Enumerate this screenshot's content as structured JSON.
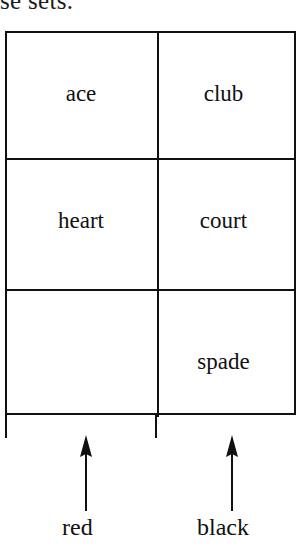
{
  "page": {
    "clipped_heading_fragment": "se sets.",
    "background_color": "#ffffff",
    "ink_color": "#111111"
  },
  "table": {
    "columns": 2,
    "rows": 3,
    "rows_data": [
      {
        "left": "ace",
        "right": "club"
      },
      {
        "left": "heart",
        "right": "court"
      },
      {
        "left": "",
        "right": "spade"
      }
    ]
  },
  "annotations": {
    "arrows": [
      {
        "icon": "arrow-up-icon",
        "label": "red",
        "column": "left"
      },
      {
        "icon": "arrow-up-icon",
        "label": "black",
        "column": "right"
      }
    ]
  }
}
